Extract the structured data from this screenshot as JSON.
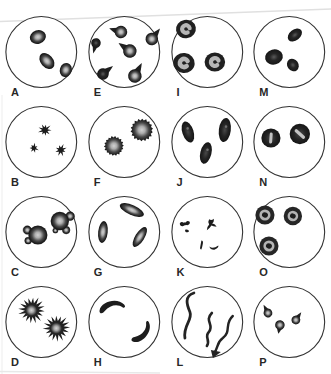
{
  "figure": {
    "colors": {
      "background": "#ffffff",
      "circle_stroke": "#333333",
      "cell_dark": "#1c1c1c",
      "pale_center": "#b6b6b6",
      "label_ink": "#272727",
      "crease": "#e0e0e0"
    },
    "shape_templates": {
      "sickle": "M -12,0.6 C -9.5,-7.8 7,-9.6 12,-1.6 C 13.4,0.4 12.4,2 10.4,1 C 6,-3.2 -1,-3.4 -7.4,2.2 C -9.8,4.6 -13,3.6 -12,0.6 Z",
      "bowtie": "M -5,-1.5 Q -3,-3.5 -1,-1.5 Q 0,-2 1,-1.5 Q 3,-3.5 5,-1.5 Q 5.5,1 2.5,1.5 Q 0,1 -2.5,1.8 Q -5.5,1.5 -5,-1.5 Z",
      "tiny": "M -2,-1 Q 0,-2 2,-0.5 Q 2.5,1 0.5,1.2 Q -2,1.5 -2,-1 Z",
      "bird": "M -1.5,-5 Q 0.5,-3.5 2.5,-5.5 Q 3,-2.5 1,-1.5 Q 4,-1 5,1.5 Q 2,1.5 0.5,0.5 Q -1,3 -3.5,4.5 Q -3.5,1.5 -1.5,-0.5 Q -3,-2.5 -1.5,-5 Z",
      "comma": "M -0.5,-4.5 Q 1.5,-4.5 1,-1.5 Q 0.5,1.5 -0.5,4.5 Q -2.5,4.5 -1.5,1 Q -1,-2 -0.5,-4.5 Z",
      "smile": "M -4.5,-0.5 Q -1,2.5 4.5,-1.5 Q 5,1 0.5,2.8 Q -3.5,3 -4.5,-0.5 Z"
    },
    "panels": [
      {
        "label": "A",
        "cells": [
          {
            "t": "disc",
            "x": 38,
            "y": 27,
            "rx": 8.2,
            "ry": 6.8,
            "rot": -18
          },
          {
            "t": "disc",
            "x": 47,
            "y": 51,
            "rx": 9,
            "ry": 6.2,
            "rot": 48
          },
          {
            "t": "disc",
            "x": 66,
            "y": 60,
            "rx": 7.2,
            "ry": 6,
            "rot": -72
          }
        ]
      },
      {
        "label": "E",
        "cells": [
          {
            "t": "teardrop",
            "x": 38,
            "y": 22,
            "r": 6.3,
            "tail": 6,
            "rot": 198,
            "pale": true
          },
          {
            "t": "teardrop",
            "x": 69,
            "y": 29,
            "r": 6.3,
            "tail": 7,
            "rot": -52,
            "pale": true
          },
          {
            "t": "teardrop",
            "x": 47,
            "y": 41,
            "r": 6.8,
            "tail": 7,
            "rot": 215,
            "pale": true
          },
          {
            "t": "teardrop",
            "x": 13,
            "y": 33,
            "r": 4.8,
            "tail": 6,
            "rot": 105,
            "pale": false
          },
          {
            "t": "teardrop",
            "x": 20,
            "y": 64,
            "r": 5.8,
            "tail": 7,
            "rot": -38,
            "pale": false
          },
          {
            "t": "teardrop",
            "x": 52,
            "y": 66,
            "r": 6.8,
            "tail": 8,
            "rot": -62,
            "pale": true
          }
        ]
      },
      {
        "label": "I",
        "cells": [
          {
            "t": "ringC",
            "x": 20,
            "y": 19,
            "r": 10,
            "open": 25,
            "tilt": -10
          },
          {
            "t": "ringC",
            "x": 18,
            "y": 53,
            "r": 10.8,
            "open": 10,
            "tilt": 5
          },
          {
            "t": "ringC",
            "x": 49,
            "y": 52,
            "r": 10.3,
            "open": 15,
            "tilt": 0
          }
        ]
      },
      {
        "label": "M",
        "cells": [
          {
            "t": "solid",
            "x": 26,
            "y": 47,
            "rx": 9,
            "ry": 7.6,
            "rot": -15
          },
          {
            "t": "solid",
            "x": 47,
            "y": 25,
            "rx": 8,
            "ry": 5.4,
            "rot": -38
          },
          {
            "t": "solid",
            "x": 45,
            "y": 55,
            "rx": 6.6,
            "ry": 5.6,
            "rot": 55
          }
        ]
      },
      {
        "label": "B",
        "cells": [
          {
            "t": "spiky",
            "x": 45,
            "y": 30,
            "R": 6.5,
            "n": 9,
            "ph": 0.2
          },
          {
            "t": "spiky",
            "x": 34,
            "y": 48,
            "R": 4.8,
            "n": 7,
            "ph": 1.1
          },
          {
            "t": "spiky",
            "x": 61,
            "y": 50,
            "R": 6,
            "n": 8,
            "ph": 2.0
          }
        ]
      },
      {
        "label": "F",
        "cells": [
          {
            "t": "burr",
            "x": 31,
            "y": 46,
            "R": 10,
            "rot": 10
          },
          {
            "t": "burr",
            "x": 59,
            "y": 30,
            "R": 11.5,
            "rot": -15
          }
        ]
      },
      {
        "label": "J",
        "cells": [
          {
            "t": "rod",
            "x": 22,
            "y": 32,
            "rx": 5.6,
            "ry": 11,
            "rot": -18
          },
          {
            "t": "rod",
            "x": 59,
            "y": 30,
            "rx": 6,
            "ry": 12,
            "rot": 7
          },
          {
            "t": "rod",
            "x": 40,
            "y": 53,
            "rx": 5.6,
            "ry": 11,
            "rot": 14
          }
        ]
      },
      {
        "label": "N",
        "cells": [
          {
            "t": "stomato",
            "x": 23,
            "y": 38,
            "r": 9.6,
            "slitRot": 4,
            "slitLen": 11,
            "slitW": 3
          },
          {
            "t": "stomato",
            "x": 52,
            "y": 34,
            "r": 10.2,
            "slitRot": -48,
            "slitLen": 13,
            "slitW": 3.2
          }
        ]
      },
      {
        "label": "C",
        "cells": [
          {
            "t": "bleb",
            "x": 38,
            "y": 45,
            "R": 9.6,
            "blebs": [
              {
                "a": 150,
                "r": 3.4
              },
              {
                "a": 205,
                "r": 4.2
              }
            ]
          },
          {
            "t": "bleb",
            "x": 60,
            "y": 31,
            "R": 9.2,
            "blebs": [
              {
                "a": -25,
                "r": 4.4
              },
              {
                "a": 55,
                "r": 3.8
              },
              {
                "a": 115,
                "r": 2.6
              }
            ]
          }
        ]
      },
      {
        "label": "G",
        "cells": [
          {
            "t": "disc",
            "x": 49,
            "y": 20,
            "rx": 13,
            "ry": 5,
            "rot": 24
          },
          {
            "t": "disc",
            "x": 20,
            "y": 42,
            "rx": 4.8,
            "ry": 11,
            "rot": 6
          },
          {
            "t": "disc",
            "x": 57,
            "y": 47,
            "rx": 11.5,
            "ry": 4.6,
            "rot": -58
          }
        ]
      },
      {
        "label": "K",
        "cells": [
          {
            "t": "fragment",
            "tpl": "bowtie",
            "x": 19,
            "y": 34,
            "rot": -8,
            "s": 1
          },
          {
            "t": "fragment",
            "tpl": "tiny",
            "x": 21,
            "y": 41,
            "rot": 10,
            "s": 1
          },
          {
            "t": "fragment",
            "tpl": "bird",
            "x": 45,
            "y": 35,
            "rot": 0,
            "s": 1.15
          },
          {
            "t": "fragment",
            "tpl": "comma",
            "x": 36,
            "y": 55,
            "rot": 0,
            "s": 1
          },
          {
            "t": "fragment",
            "tpl": "smile",
            "x": 48,
            "y": 57,
            "rot": 0,
            "s": 1
          }
        ]
      },
      {
        "label": "O",
        "cells": [
          {
            "t": "target",
            "x": 17,
            "y": 25,
            "r": 9.6
          },
          {
            "t": "target",
            "x": 45,
            "y": 26,
            "r": 9.2
          },
          {
            "t": "target",
            "x": 21,
            "y": 56,
            "r": 9.6
          }
        ]
      },
      {
        "label": "D",
        "cells": [
          {
            "t": "acantho",
            "x": 32,
            "y": 30,
            "R": 13.5,
            "rot": 0
          },
          {
            "t": "acantho",
            "x": 57,
            "y": 48,
            "R": 13.5,
            "rot": 14
          }
        ]
      },
      {
        "label": "H",
        "cells": [
          {
            "t": "sickle",
            "x": 29,
            "y": 28,
            "rot": -8,
            "s": 1.05,
            "flip": false
          },
          {
            "t": "sickle",
            "x": 58,
            "y": 52,
            "rot": 125,
            "s": 1.02,
            "flip": true
          }
        ]
      },
      {
        "label": "L",
        "cells": [
          {
            "t": "worm",
            "d": "M 28,13 C 18,16 21,25 24,32 C 27,40 17,45 19,58",
            "w": 2.8
          },
          {
            "t": "worm",
            "d": "M 46,33 C 38,41 49,45 43,52 C 38,57 45,60 41,66",
            "w": 2.6
          },
          {
            "t": "worm",
            "d": "M 67,36 C 58,44 66,51 57,58 C 50,63 53,68 48,73",
            "w": 2.4,
            "tip": "45,70 55,72 47,78"
          }
        ]
      },
      {
        "label": "P",
        "cells": [
          {
            "t": "teardrop",
            "x": 20,
            "y": 33,
            "r": 4.4,
            "tail": 5,
            "rot": -118,
            "pale": true
          },
          {
            "t": "teardrop",
            "x": 32,
            "y": 45,
            "r": 4.8,
            "tail": 4,
            "rot": 100,
            "pale": true
          },
          {
            "t": "teardrop",
            "x": 48,
            "y": 40,
            "r": 4.4,
            "tail": 5,
            "rot": -55,
            "pale": true
          }
        ]
      }
    ]
  }
}
